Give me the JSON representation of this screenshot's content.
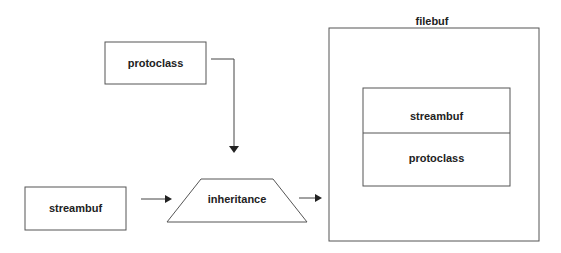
{
  "diagram": {
    "nodes": {
      "protoclass": {
        "label": "protoclass"
      },
      "streambuf": {
        "label": "streambuf"
      },
      "inheritance": {
        "label": "inheritance"
      },
      "filebuf": {
        "label": "filebuf",
        "parts": [
          {
            "label": "streambuf"
          },
          {
            "label": "protoclass"
          }
        ]
      }
    },
    "edges": [
      {
        "from": "protoclass",
        "to": "inheritance"
      },
      {
        "from": "streambuf",
        "to": "inheritance"
      },
      {
        "from": "inheritance",
        "to": "filebuf"
      }
    ],
    "colors": {
      "stroke": "#444444",
      "text": "#222222",
      "background": "#ffffff"
    }
  }
}
